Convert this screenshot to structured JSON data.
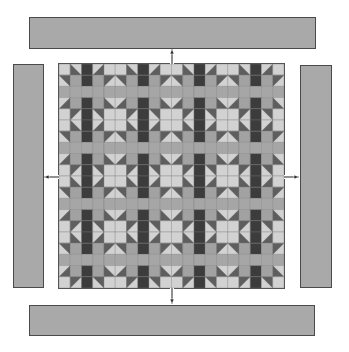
{
  "diagram": {
    "type": "quilt-assembly-exploded-borders",
    "colors": {
      "light": "#d2d2d2",
      "medium": "#a6a6a6",
      "corner": "#a2a2a2",
      "point_dark": "#5e5e5e",
      "sashing_dark": "#3c3c3c",
      "border": "#a9a9a9",
      "outline": "#4a4a4a"
    },
    "quilt_center": {
      "grid_cols": 20,
      "grid_rows": 20,
      "block": "sawtooth-star",
      "block_size_cells": 4,
      "repeat_cells": 5,
      "offset_cells": -2,
      "vertical_sashing": "dark",
      "horizontal_sashing": "medium"
    },
    "borders": [
      {
        "name": "top-border",
        "x": 29,
        "y": 17,
        "w": 287,
        "h": 32
      },
      {
        "name": "bottom-border",
        "x": 29,
        "y": 305,
        "w": 286,
        "h": 31
      },
      {
        "name": "left-border",
        "x": 13,
        "y": 64,
        "w": 31,
        "h": 224
      },
      {
        "name": "right-border",
        "x": 300,
        "y": 65,
        "w": 32,
        "h": 223
      }
    ],
    "arrows": [
      {
        "name": "arrow-up",
        "x1": 172,
        "y1": 64,
        "x2": 172,
        "y2": 49
      },
      {
        "name": "arrow-down",
        "x1": 172,
        "y1": 288,
        "x2": 172,
        "y2": 304
      },
      {
        "name": "arrow-left",
        "x1": 59,
        "y1": 177,
        "x2": 44,
        "y2": 177
      },
      {
        "name": "arrow-right",
        "x1": 284,
        "y1": 177,
        "x2": 299,
        "y2": 177
      }
    ]
  }
}
